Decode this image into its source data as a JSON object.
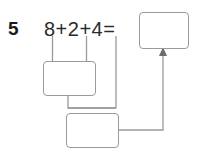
{
  "worksheet": {
    "problem_number": "5",
    "equation": "8+2+4=",
    "addends": [
      "8",
      "2",
      "4"
    ],
    "operators": [
      "+",
      "+"
    ],
    "equals": "=",
    "line_color": "#9a9a9a",
    "text_color": "#2b2b2b",
    "number_color": "#1b1b1b",
    "background": "#ffffff"
  },
  "boxes": {
    "sum": {
      "name": "final sum box",
      "value": ""
    },
    "partial_1": {
      "name": "first partial sum box",
      "value": ""
    },
    "partial_2": {
      "name": "second partial sum box",
      "value": ""
    }
  },
  "connectors": {
    "bracket_8_2": "bracket grouping 8 and 2 into first partial sum box",
    "bracket_partial1_4": "bracket grouping first partial sum and 4 into second partial sum box",
    "arrow_to_sum": "arrow from second partial sum box up into final sum box"
  }
}
